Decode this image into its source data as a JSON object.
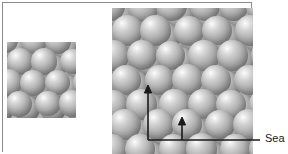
{
  "figure": {
    "type": "close-packed-sphere-crystal-structure",
    "background_color": "#ffffff",
    "frame_color": "#8c8c8c",
    "sphere_color": "#b4b4b4",
    "annotation_color": "#1a1a1a"
  },
  "panels": {
    "small": {
      "name": "small-sphere-packing-panel",
      "x": 7,
      "y": 42,
      "width": 69,
      "height": 76,
      "columns": 3,
      "rows": 3
    },
    "large": {
      "name": "large-sphere-packing-panel",
      "x": 112,
      "y": 8,
      "width": 141,
      "height": 146,
      "columns": 5,
      "rows": 6
    }
  },
  "annotations": {
    "vertical_arrow": {
      "name": "vertical-dimension-arrow",
      "x": 148,
      "tip_y": 85,
      "base_y": 140
    },
    "short_arrow": {
      "name": "short-dimension-arrow",
      "x": 182,
      "tip_y": 117,
      "base_y": 140
    },
    "baseline": {
      "name": "horizontal-baseline",
      "y": 140,
      "x_start": 148,
      "x_end": 260
    }
  },
  "callout": {
    "label": "Sea",
    "leader_line_color": "#1a1a1a"
  }
}
